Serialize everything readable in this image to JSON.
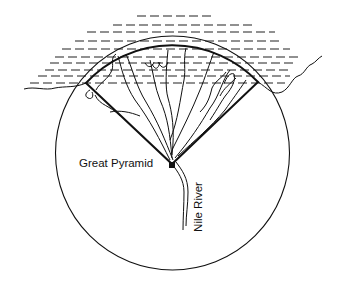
{
  "diagram": {
    "labels": {
      "pyramid": "Great Pyramid",
      "river": "Nile River"
    },
    "elements": [
      "sea-hatching",
      "coastline",
      "circle",
      "delta-sector",
      "delta-channels",
      "pyramid-marker",
      "nile-river"
    ],
    "colors": {
      "stroke": "#111111",
      "background": "#ffffff"
    }
  }
}
